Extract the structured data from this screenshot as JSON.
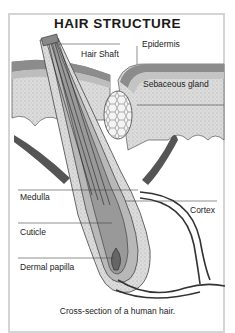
{
  "title": "HAIR STRUCTURE",
  "labels": {
    "hair_shaft": "Hair Shaft",
    "epidermis": "Epidermis",
    "sebaceous_gland": "Sebaceous gland",
    "medulla": "Medulla",
    "cortex": "Cortex",
    "cuticle": "Cuticle",
    "dermal_papilla": "Dermal papilla"
  },
  "caption": "Cross-section of a human hair.",
  "colors": {
    "frame": "#d4d4d4",
    "skin_dark": "#8c8c8c",
    "skin_light": "#d6d6d6",
    "follicle": "#b8b8b8",
    "muscle": "#555555",
    "line": "#333333"
  }
}
